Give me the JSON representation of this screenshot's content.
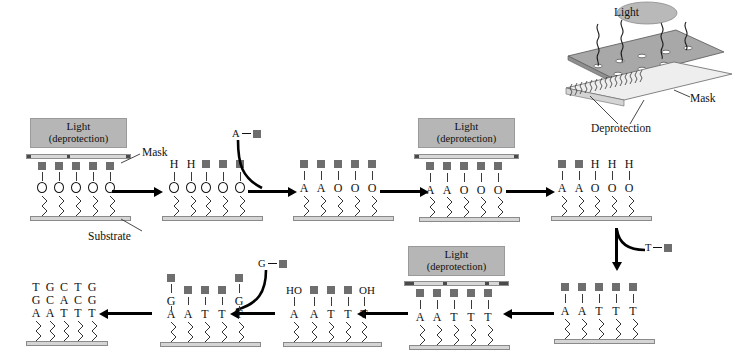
{
  "figure": {
    "substrate_label": "Substrate",
    "mask_label": "Mask",
    "light_label": "Light",
    "deprotection_paren": "(deprotection)",
    "deprotection_label": "Deprotection"
  },
  "light_boxes": [
    {
      "id": "light-box-1",
      "line1": "Light",
      "line2": "(deprotection)"
    },
    {
      "id": "light-box-2",
      "line1": "Light",
      "line2": "(deprotection)"
    },
    {
      "id": "light-box-3",
      "line1": "Light",
      "line2": "(deprotection)"
    }
  ],
  "inset": {
    "light_label": "Light",
    "mask_label": "Mask",
    "deprotection_label": "Deprotection"
  },
  "reagents": [
    {
      "id": "reagent-a",
      "base": "A"
    },
    {
      "id": "reagent-t",
      "base": "T"
    },
    {
      "id": "reagent-g",
      "base": "G"
    }
  ],
  "panels": [
    {
      "id": "panel-1",
      "top_row": [
        "",
        "",
        "",
        "",
        ""
      ],
      "base_row": [
        "O",
        "O",
        "O",
        "O",
        "O"
      ],
      "has_mask": true,
      "has_light": true,
      "caps": [
        "sq",
        "sq",
        "sq",
        "sq",
        "sq"
      ]
    },
    {
      "id": "panel-2",
      "top_row": [
        "H",
        "H",
        "",
        "",
        ""
      ],
      "base_row": [
        "O",
        "O",
        "O",
        "O",
        "O"
      ],
      "has_mask": false,
      "has_light": false,
      "caps": [
        "",
        "",
        "sq",
        "sq",
        "sq"
      ]
    },
    {
      "id": "panel-3",
      "top_row": [
        "",
        "",
        "",
        "",
        ""
      ],
      "base_row": [
        "A",
        "A",
        "O",
        "O",
        "O"
      ],
      "has_mask": false,
      "has_light": false,
      "caps": [
        "sq",
        "sq",
        "sq",
        "sq",
        "sq"
      ]
    },
    {
      "id": "panel-4",
      "top_row": [
        "",
        "",
        "",
        "",
        ""
      ],
      "base_row": [
        "A",
        "A",
        "O",
        "O",
        "O"
      ],
      "has_mask": true,
      "has_light": true,
      "caps": [
        "sq",
        "sq",
        "sq",
        "sq",
        "sq"
      ]
    },
    {
      "id": "panel-5",
      "top_row": [
        "",
        "",
        "H",
        "H",
        "H"
      ],
      "base_row": [
        "A",
        "A",
        "O",
        "O",
        "O"
      ],
      "has_mask": false,
      "has_light": false,
      "caps": [
        "sq",
        "sq",
        "",
        "",
        ""
      ]
    },
    {
      "id": "panel-6",
      "top_row": [
        "",
        "",
        "",
        "",
        ""
      ],
      "base_row": [
        "A",
        "A",
        "T",
        "T",
        "T"
      ],
      "has_mask": false,
      "has_light": false,
      "caps": [
        "sq",
        "sq",
        "sq",
        "sq",
        "sq"
      ]
    },
    {
      "id": "panel-7",
      "top_row": [
        "",
        "",
        "",
        "",
        ""
      ],
      "base_row": [
        "A",
        "A",
        "T",
        "T",
        "T"
      ],
      "has_mask": true,
      "has_light": true,
      "caps": [
        "sq",
        "sq",
        "sq",
        "sq",
        "sq"
      ]
    },
    {
      "id": "panel-8",
      "top_row": [
        "HO",
        "",
        "",
        "",
        "OH"
      ],
      "base_row": [
        "A",
        "A",
        "T",
        "T",
        "T"
      ],
      "has_mask": false,
      "has_light": false,
      "caps": [
        "",
        "sq",
        "sq",
        "sq",
        ""
      ]
    },
    {
      "id": "panel-9",
      "mid_row": [
        "G",
        "",
        "",
        "",
        "G"
      ],
      "base_row": [
        "A",
        "A",
        "T",
        "T",
        "T"
      ],
      "has_mask": false,
      "has_light": false,
      "caps": [
        "sq-high",
        "sq-low",
        "sq-low",
        "sq-low",
        "sq-high"
      ]
    },
    {
      "id": "panel-10",
      "row_top": [
        "T",
        "G",
        "C",
        "T",
        "G"
      ],
      "row_mid": [
        "G",
        "C",
        "A",
        "C",
        "G"
      ],
      "row_bottom": [
        "A",
        "A",
        "T",
        "T",
        "T"
      ],
      "has_mask": false,
      "has_light": false
    }
  ],
  "sequences": {
    "final_top": "TGCTG",
    "final_mid": "GCACG",
    "final_bottom": "AATTT"
  },
  "colors": {
    "light_box_fill": "#b6b6b6",
    "square_fill": "#6e6e6e",
    "substrate_fill": "#d5d5d5",
    "mask_fill": "#d8d8d8",
    "mask_block": "#4a4a4a",
    "line": "#111111"
  }
}
